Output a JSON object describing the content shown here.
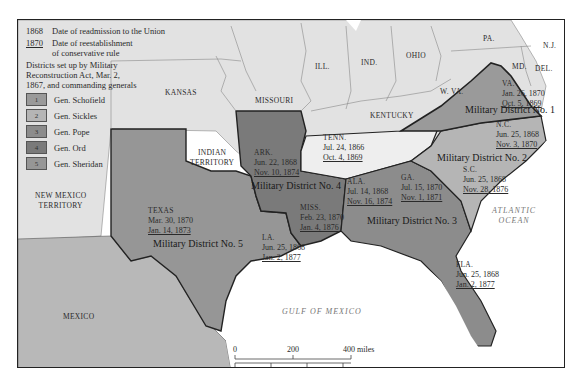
{
  "legend": {
    "readmission": {
      "year": "1868",
      "text": "Date of readmission to the Union"
    },
    "conservative": {
      "year": "1870",
      "text": "Date of reestablishment",
      "text2": "of conservative rule"
    },
    "districts_title": [
      "Districts set up by Military",
      "Reconstruction Act, Mar. 2,",
      "1867, and commanding generals"
    ],
    "generals": [
      {
        "num": "1",
        "name": "Gen. Schofield",
        "color": "#9a9a9a"
      },
      {
        "num": "2",
        "name": "Gen. Sickles",
        "color": "#b5b5b5"
      },
      {
        "num": "3",
        "name": "Gen. Pope",
        "color": "#8c8c8c"
      },
      {
        "num": "4",
        "name": "Gen. Ord",
        "color": "#7a7a7a"
      },
      {
        "num": "5",
        "name": "Gen. Sheridan",
        "color": "#969696"
      }
    ]
  },
  "states": {
    "kansas": "KANSAS",
    "missouri": "MISSOURI",
    "ill": "ILL.",
    "ind": "IND.",
    "ohio": "OHIO",
    "pa": "PA.",
    "nj": "N.J.",
    "md": "MD.",
    "del": "DEL.",
    "wva": "W. VA.",
    "kentucky": "KENTUCKY",
    "indian_territory": [
      "INDIAN",
      "TERRITORY"
    ],
    "new_mexico": [
      "NEW MEXICO",
      "TERRITORY"
    ],
    "mexico": "MEXICO"
  },
  "reconstruction_states": {
    "va": {
      "name": "VA.",
      "readmitted": "Jan. 26, 1870",
      "conservative": "Oct. 5, 1869"
    },
    "nc": {
      "name": "N.C.",
      "readmitted": "Jun. 25, 1868",
      "conservative": "Nov. 3, 1870"
    },
    "sc": {
      "name": "S.C.",
      "readmitted": "Jun. 25, 1868",
      "conservative": "Nov. 28, 1876"
    },
    "tenn": {
      "name": "TENN.",
      "readmitted": "Jul. 24, 1866",
      "conservative": "Oct. 4, 1869"
    },
    "ark": {
      "name": "ARK.",
      "readmitted": "Jun. 22, 1868",
      "conservative": "Nov. 10, 1874"
    },
    "ala": {
      "name": "ALA.",
      "readmitted": "Jul. 14, 1868",
      "conservative": "Nov. 16, 1874"
    },
    "ga": {
      "name": "GA.",
      "readmitted": "Jul. 15, 1870",
      "conservative": "Nov. 1, 1871"
    },
    "miss": {
      "name": "MISS.",
      "readmitted": "Feb. 23, 1870",
      "conservative": "Jan. 4, 1876"
    },
    "texas": {
      "name": "TEXAS",
      "readmitted": "Mar. 30, 1870",
      "conservative": "Jan. 14, 1873"
    },
    "la": {
      "name": "LA.",
      "readmitted": "Jun. 25, 1868",
      "conservative": "Jan. 2, 1877"
    },
    "fla": {
      "name": "FLA.",
      "readmitted": "Jun. 25, 1868",
      "conservative": "Jan. 2, 1877"
    }
  },
  "districts": {
    "d1": "Military District No. 1",
    "d2": "Military District No. 2",
    "d3": "Military District No. 3",
    "d4": "Military District No. 4",
    "d5": "Military District No. 5"
  },
  "water": {
    "atlantic": [
      "ATLANTIC",
      "OCEAN"
    ],
    "gulf": "GULF OF MEXICO"
  },
  "scale": {
    "miles": [
      "0",
      "200",
      "400 miles"
    ],
    "km": [
      "0",
      "200",
      "400",
      "600 kilometers"
    ]
  },
  "colors": {
    "land_other": "#e4e4e4",
    "d1": "#9a9a9a",
    "d2": "#b5b5b5",
    "d3": "#8c8c8c",
    "d4": "#7a7a7a",
    "d5": "#969696",
    "mexico": "#b8b8b8",
    "water": "#ffffff"
  }
}
